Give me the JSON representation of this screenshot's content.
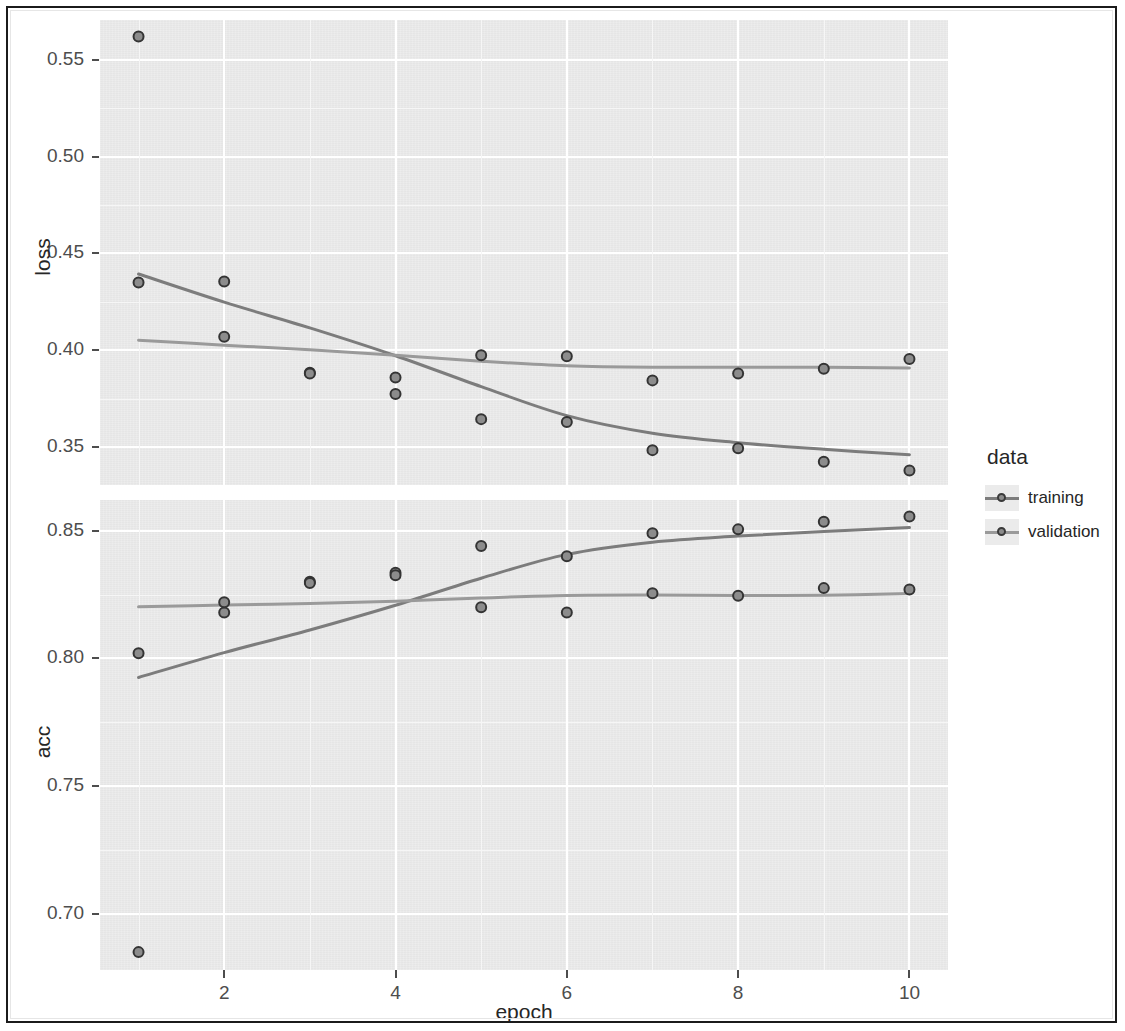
{
  "figure": {
    "x_axis_title": "epoch",
    "x_ticks": [
      "2",
      "4",
      "6",
      "8",
      "10"
    ],
    "panels": [
      {
        "name": "loss",
        "y_title": "loss",
        "y_ticks": [
          "0.55",
          "0.50",
          "0.45",
          "0.40",
          "0.35"
        ]
      },
      {
        "name": "acc",
        "y_title": "acc",
        "y_ticks": [
          "0.85",
          "0.80",
          "0.75",
          "0.70"
        ]
      }
    ]
  },
  "legend": {
    "title": "data",
    "items": [
      {
        "label": "training",
        "color": "#7c7c7c"
      },
      {
        "label": "validation",
        "color": "#9a9a9a"
      }
    ]
  },
  "colors": {
    "panel_background": "#ebebeb",
    "grid_major": "#ffffff",
    "grid_minor": "#f6f6f6",
    "point_stroke": "#343434",
    "point_fill": "#8c8c8c",
    "training_line": "#7c7c7c",
    "validation_line": "#9a9a9a",
    "text": "#262626",
    "frame": "#1b1b1b"
  },
  "chart_data": {
    "type": "line",
    "title": "",
    "xlabel": "epoch",
    "x": [
      1,
      2,
      3,
      4,
      5,
      6,
      7,
      8,
      9,
      10
    ],
    "xlim": [
      0.55,
      10.45
    ],
    "facets": [
      {
        "name": "loss",
        "ylabel": "loss",
        "ylim": [
          0.3305,
          0.5705
        ],
        "yticks": [
          0.55,
          0.5,
          0.45,
          0.4,
          0.35
        ],
        "grid": true,
        "series": [
          {
            "name": "training",
            "color": "#7c7c7c",
            "values": [
              0.562,
              0.4355,
              0.3885,
              0.3775,
              0.3645,
              0.363,
              0.3485,
              0.3495,
              0.3425,
              0.338
            ]
          },
          {
            "name": "validation",
            "color": "#9a9a9a",
            "values": [
              0.435,
              0.407,
              0.388,
              0.386,
              0.3975,
              0.397,
              0.3845,
              0.388,
              0.3905,
              0.3955
            ]
          }
        ]
      },
      {
        "name": "acc",
        "ylabel": "acc",
        "ylim": [
          0.678,
          0.862
        ],
        "yticks": [
          0.85,
          0.8,
          0.75,
          0.7
        ],
        "grid": true,
        "series": [
          {
            "name": "training",
            "color": "#7c7c7c",
            "values": [
              0.685,
              0.818,
              0.83,
              0.8335,
              0.844,
              0.84,
              0.849,
              0.8505,
              0.8535,
              0.8555
            ]
          },
          {
            "name": "validation",
            "color": "#9a9a9a",
            "values": [
              0.802,
              0.822,
              0.8295,
              0.8325,
              0.82,
              0.818,
              0.8255,
              0.8245,
              0.8275,
              0.827
            ]
          }
        ]
      }
    ],
    "legend": {
      "title": "data",
      "position": "right",
      "entries": [
        "training",
        "validation"
      ]
    }
  }
}
